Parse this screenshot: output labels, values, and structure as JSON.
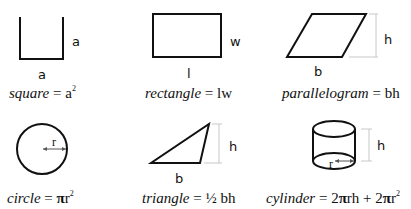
{
  "shapes": [
    {
      "id": "square",
      "labels": {
        "side_right": "a",
        "side_bottom": "a"
      },
      "formula": {
        "name": "square",
        "eq": " = ",
        "expr": "a",
        "sup": "2"
      }
    },
    {
      "id": "rectangle",
      "labels": {
        "width": "w",
        "length": "l"
      },
      "formula": {
        "name": "rectangle",
        "eq": " = ",
        "expr": "lw"
      }
    },
    {
      "id": "parallelogram",
      "labels": {
        "height": "h",
        "base": "b"
      },
      "formula": {
        "name": "parallelogram",
        "eq": " = ",
        "expr": "bh"
      }
    },
    {
      "id": "circle",
      "labels": {
        "radius": "r"
      },
      "formula": {
        "name": "circle",
        "eq": " = ",
        "pi": "π",
        "expr": "r",
        "sup": "2"
      }
    },
    {
      "id": "triangle",
      "labels": {
        "height": "h",
        "base": "b"
      },
      "formula": {
        "name": "triangle",
        "eq": " = ",
        "frac": "½",
        "expr": " bh"
      }
    },
    {
      "id": "cylinder",
      "labels": {
        "height": "h",
        "radius": "r"
      },
      "formula": {
        "name": "cylinder",
        "eq": " = ",
        "part1": "2",
        "pi1": "π",
        "part2": "rh + 2",
        "pi2": "π",
        "part3": "r",
        "sup": "2"
      }
    }
  ],
  "colors": {
    "stroke": "#111111",
    "dimension": "#c8c8c8"
  }
}
